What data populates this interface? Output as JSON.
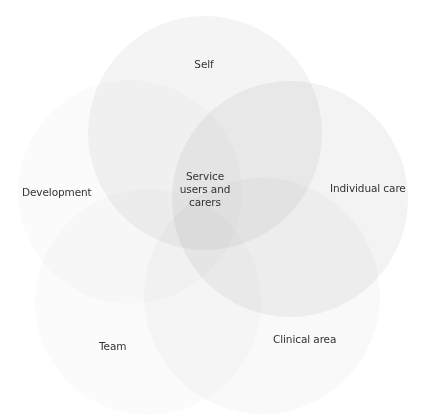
{
  "diagram": {
    "type": "venn",
    "center_label": "Service users and carers",
    "center_lines": [
      "Service",
      "users and",
      "carers"
    ],
    "circles": [
      {
        "id": "development",
        "label": "Development",
        "cx": 130,
        "cy": 192,
        "r": 112,
        "fill": "#fbfbfb"
      },
      {
        "id": "team",
        "label": "Team",
        "cx": 148,
        "cy": 302,
        "r": 113,
        "fill": "#fbfbfb"
      },
      {
        "id": "clinical-area",
        "label": "Clinical area",
        "cx": 262,
        "cy": 296,
        "r": 118,
        "fill": "#f9f9f9"
      },
      {
        "id": "self",
        "label": "Self",
        "cx": 205,
        "cy": 133,
        "r": 117,
        "fill": "#f4f4f4"
      },
      {
        "id": "individual-care",
        "label": "Individual care",
        "cx": 290,
        "cy": 199,
        "r": 118,
        "fill": "#f3f3f3"
      }
    ],
    "label_color": "#333333"
  },
  "labels": {
    "self": "Self",
    "development": "Development",
    "individual_care": "Individual care",
    "team": "Team",
    "clinical_area": "Clinical area",
    "center_1": "Service",
    "center_2": "users and",
    "center_3": "carers"
  }
}
